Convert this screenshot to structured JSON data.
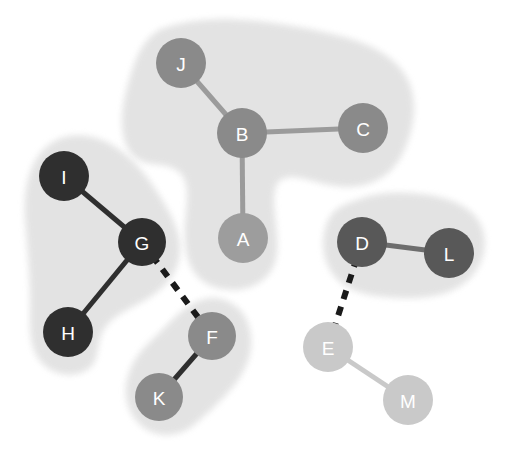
{
  "diagram": {
    "type": "graph",
    "background": "#ffffff",
    "node_radius_default": 24,
    "label_color": "#ffffff",
    "palette": {
      "very_dark": "#2f2f2f",
      "dark": "#585858",
      "medium": "#8a8a8a",
      "medium_light": "#9d9d9d",
      "light": "#c9c9c9",
      "cluster_fill": "#e0e0e0",
      "dashed_edge": "#1a1a1a"
    },
    "nodes": [
      {
        "id": "A",
        "label": "A",
        "x": 243,
        "y": 238,
        "r": 25,
        "color": "#9d9d9d",
        "cluster": "cluster-top"
      },
      {
        "id": "B",
        "label": "B",
        "x": 242,
        "y": 133,
        "r": 25,
        "color": "#8a8a8a",
        "cluster": "cluster-top"
      },
      {
        "id": "C",
        "label": "C",
        "x": 363,
        "y": 128,
        "r": 25,
        "color": "#8a8a8a",
        "cluster": "cluster-top"
      },
      {
        "id": "J",
        "label": "J",
        "x": 181,
        "y": 63,
        "r": 25,
        "color": "#8a8a8a",
        "cluster": "cluster-top"
      },
      {
        "id": "I",
        "label": "I",
        "x": 64,
        "y": 176,
        "r": 25,
        "color": "#2f2f2f",
        "cluster": "cluster-left"
      },
      {
        "id": "G",
        "label": "G",
        "x": 142,
        "y": 242,
        "r": 24,
        "color": "#2f2f2f",
        "cluster": "cluster-left"
      },
      {
        "id": "H",
        "label": "H",
        "x": 68,
        "y": 332,
        "r": 25,
        "color": "#2f2f2f",
        "cluster": "cluster-left"
      },
      {
        "id": "F",
        "label": "F",
        "x": 212,
        "y": 336,
        "r": 24,
        "color": "#8a8a8a",
        "cluster": "cluster-fk"
      },
      {
        "id": "K",
        "label": "K",
        "x": 159,
        "y": 397,
        "r": 24,
        "color": "#8a8a8a",
        "cluster": "cluster-fk"
      },
      {
        "id": "D",
        "label": "D",
        "x": 362,
        "y": 242,
        "r": 25,
        "color": "#585858",
        "cluster": "cluster-dl"
      },
      {
        "id": "L",
        "label": "L",
        "x": 449,
        "y": 253,
        "r": 25,
        "color": "#585858",
        "cluster": "cluster-dl"
      },
      {
        "id": "E",
        "label": "E",
        "x": 328,
        "y": 347,
        "r": 25,
        "color": "#c9c9c9",
        "cluster": null
      },
      {
        "id": "M",
        "label": "M",
        "x": 408,
        "y": 400,
        "r": 25,
        "color": "#c9c9c9",
        "cluster": null
      }
    ],
    "edges": [
      {
        "source": "J",
        "target": "B",
        "style": "solid",
        "color": "#9b9b9b",
        "width": 5
      },
      {
        "source": "B",
        "target": "C",
        "style": "solid",
        "color": "#9b9b9b",
        "width": 5
      },
      {
        "source": "B",
        "target": "A",
        "style": "solid",
        "color": "#9b9b9b",
        "width": 5
      },
      {
        "source": "I",
        "target": "G",
        "style": "solid",
        "color": "#2f2f2f",
        "width": 5
      },
      {
        "source": "G",
        "target": "H",
        "style": "solid",
        "color": "#2f2f2f",
        "width": 5
      },
      {
        "source": "F",
        "target": "K",
        "style": "solid",
        "color": "#2f2f2f",
        "width": 5
      },
      {
        "source": "D",
        "target": "L",
        "style": "solid",
        "color": "#6d6d6d",
        "width": 5
      },
      {
        "source": "E",
        "target": "M",
        "style": "solid",
        "color": "#c9c9c9",
        "width": 5
      },
      {
        "source": "G",
        "target": "F",
        "style": "dashed",
        "color": "#1a1a1a",
        "width": 6
      },
      {
        "source": "D",
        "target": "E",
        "style": "dashed",
        "color": "#1a1a1a",
        "width": 6
      }
    ],
    "clusters": [
      {
        "id": "cluster-top",
        "members": [
          "J",
          "B",
          "C",
          "A"
        ],
        "fill": "#e2e2e2",
        "path": "M 162,34 C 205,18 258,24 303,33 C 345,41 382,50 400,76 C 415,98 409,130 398,152 C 386,176 362,185 336,181 C 312,178 295,166 278,176 C 268,182 268,198 270,216 C 273,240 276,261 262,274 C 246,289 218,288 203,275 C 190,263 189,243 190,224 C 192,200 196,180 182,168 C 168,156 148,163 137,153 C 124,140 125,113 132,88 C 139,62 146,43 162,34 Z"
      },
      {
        "id": "cluster-left",
        "members": [
          "I",
          "G",
          "H"
        ],
        "fill": "#e2e2e2",
        "path": "M 56,146 C 74,136 96,140 114,152 C 134,165 148,186 160,206 C 172,226 179,244 173,263 C 167,281 151,292 135,300 C 118,309 104,316 97,332 C 91,347 95,359 84,366 C 70,374 51,369 42,355 C 33,341 35,322 35,300 C 35,272 32,246 30,219 C 28,192 33,160 56,146 Z"
      },
      {
        "id": "cluster-fk",
        "members": [
          "F",
          "K"
        ],
        "fill": "#e2e2e2",
        "path": "M 205,304 C 222,300 239,310 244,327 C 250,345 244,364 232,380 C 219,397 204,410 191,421 C 177,432 160,433 147,424 C 133,414 128,396 132,380 C 136,362 148,350 161,338 C 175,325 188,308 205,304 Z"
      },
      {
        "id": "cluster-dl",
        "members": [
          "D",
          "L"
        ],
        "fill": "#e2e2e2",
        "path": "M 355,206 C 378,196 404,196 429,200 C 452,204 472,213 478,231 C 484,250 475,270 459,281 C 443,292 421,294 400,293 C 376,292 355,289 342,277 C 328,264 325,243 331,226 C 336,213 344,210 355,206 Z"
      }
    ]
  }
}
